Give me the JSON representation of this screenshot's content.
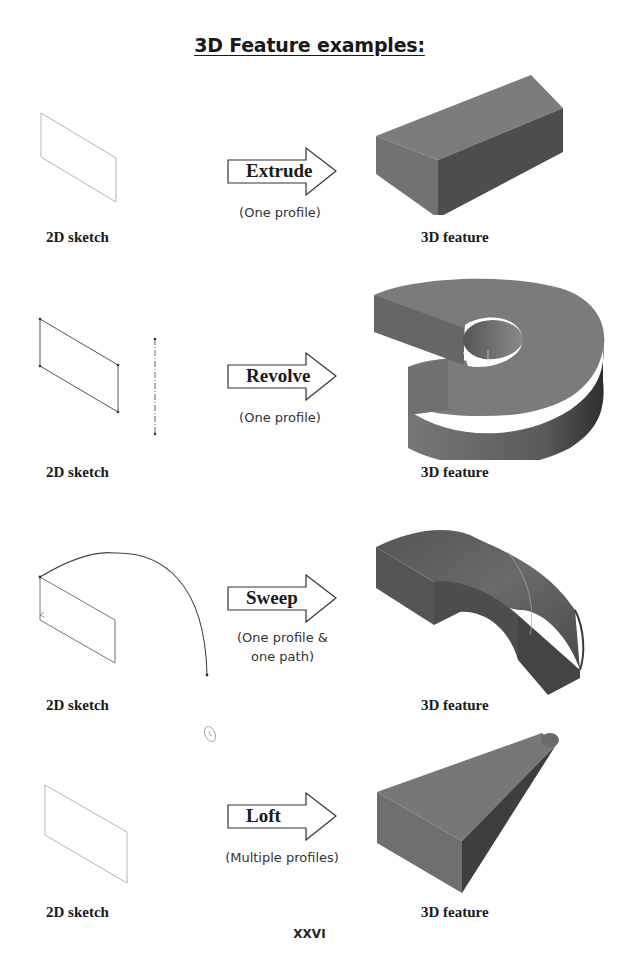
{
  "page": {
    "title": "3D Feature examples:",
    "page_number": "XXVI"
  },
  "examples": [
    {
      "feature": "Extrude",
      "description": "(One profile)",
      "sketch_label": "2D sketch",
      "result_label": "3D feature",
      "sketch_icon": "parallelogram-profile-icon",
      "model_icon": "rectangular-block-icon"
    },
    {
      "feature": "Revolve",
      "description": "(One profile)",
      "sketch_label": "2D sketch",
      "result_label": "3D feature",
      "sketch_icon": "profile-with-axis-icon",
      "model_icon": "revolved-ring-icon"
    },
    {
      "feature": "Sweep",
      "description_line1": "(One profile &",
      "description_line2": "one path)",
      "sketch_label": "2D sketch",
      "result_label": "3D feature",
      "sketch_icon": "profile-with-path-icon",
      "model_icon": "swept-bend-icon"
    },
    {
      "feature": "Loft",
      "description": "(Multiple profiles)",
      "sketch_label": "2D sketch",
      "result_label": "3D feature",
      "sketch_icon": "parallelogram-profile-icon",
      "model_icon": "lofted-taper-icon"
    }
  ],
  "colors": {
    "solid_top": "#7a7a7a",
    "solid_front": "#6e6e6e",
    "solid_side": "#4a4a4a",
    "sketch_line": "#9a9a9a",
    "text": "#1a1a1a"
  }
}
